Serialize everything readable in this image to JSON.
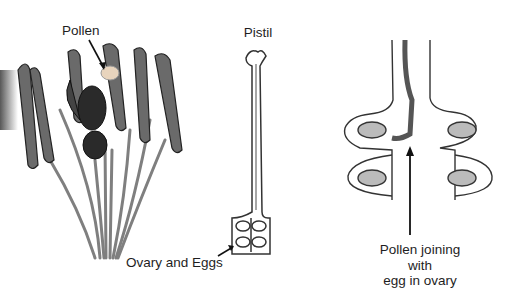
{
  "diagram": {
    "panels": [
      {
        "id": "flower",
        "label": "Pollen"
      },
      {
        "id": "pistil",
        "label": "Pistil",
        "ovary_label": "Ovary and Eggs"
      },
      {
        "id": "ovary_closeup",
        "label": "Pollen joining with\negg in ovary"
      }
    ]
  },
  "colors": {
    "ink": "#1e1e1e",
    "stem": "#7a7a7a",
    "pollen": "#e8d4bd",
    "anther": "#555555"
  }
}
